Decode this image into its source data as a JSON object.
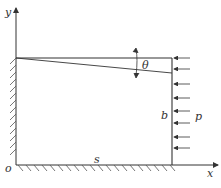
{
  "diagram": {
    "labels": {
      "y_axis": "y",
      "x_axis": "x",
      "origin": "o",
      "length": "s",
      "height": "b",
      "pressure": "p",
      "angle": "θ"
    },
    "load_arrows_count": 8,
    "colors": {
      "line": "#333333",
      "hatch": "#555555",
      "background": "#ffffff"
    }
  }
}
